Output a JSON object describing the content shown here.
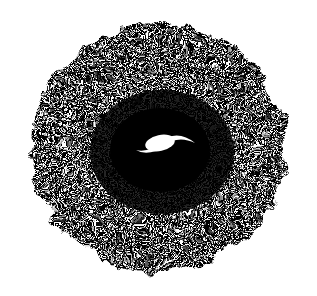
{
  "image": {
    "width": 317,
    "height": 296,
    "background": "#ffffff",
    "foreground": "#000000",
    "subject": "stippled-dark-cloud-with-bright-spiral-core",
    "cloud": {
      "cx": 158,
      "cy": 148,
      "rx": 132,
      "ry": 128
    },
    "dense_core": {
      "cx": 160,
      "cy": 150,
      "rx": 70,
      "ry": 62
    },
    "bright_spiral": {
      "cx": 161,
      "cy": 144
    }
  }
}
